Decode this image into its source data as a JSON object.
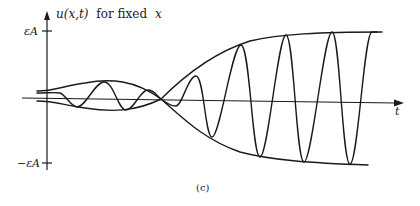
{
  "figure": {
    "panel_label": "(c)",
    "y_axis": {
      "label_func": "u(x,t)",
      "label_rest": "for fixed",
      "label_var": "x",
      "tick_upper": "εA",
      "tick_lower": "−εA"
    },
    "x_axis": {
      "label": "t"
    },
    "colors": {
      "ink": "#1a1a1a",
      "background": "#ffffff"
    }
  }
}
